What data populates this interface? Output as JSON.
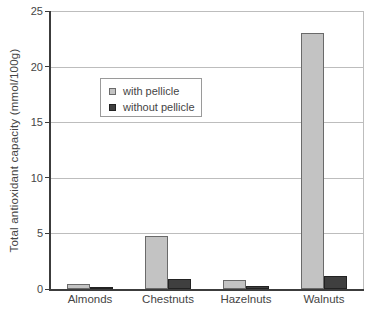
{
  "figure": {
    "background": "#ffffff"
  },
  "chart_data": {
    "type": "bar",
    "title": "",
    "xlabel": "",
    "ylabel": "Total antioxidant capacity (mmol/100g)",
    "ylim": [
      0,
      25
    ],
    "yticks": [
      0,
      5,
      10,
      15,
      20,
      25
    ],
    "grid": "horizontal gridlines every 5 units",
    "legend_position": "inside upper-left",
    "categories": [
      "Almonds",
      "Chestnuts",
      "Hazelnuts",
      "Walnuts"
    ],
    "series": [
      {
        "name": "with pellicle",
        "fill": "#c3c3c3",
        "border": "#6a6a6a",
        "values": [
          0.45,
          4.8,
          0.85,
          23
        ]
      },
      {
        "name": "without pellicle",
        "fill": "#3f3f3f",
        "border": "#222222",
        "values": [
          0.2,
          0.9,
          0.25,
          1.2
        ]
      }
    ],
    "colors": {
      "gridline": "#bdbdbd",
      "axis": "#3c3c3c",
      "plot_border": "#bdbdbd",
      "text": "#454545",
      "legend_border": "#9a9a9a",
      "background": "#ffffff"
    }
  }
}
